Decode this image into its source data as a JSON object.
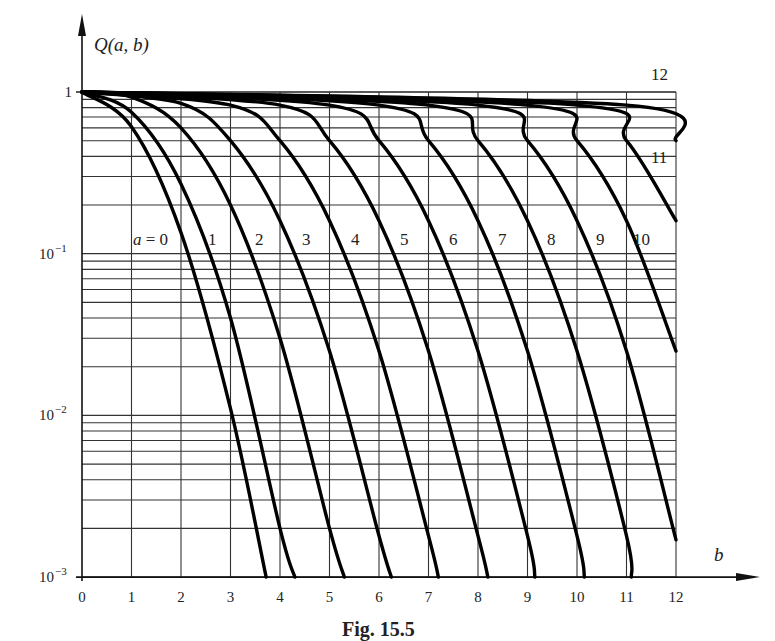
{
  "figure": {
    "caption": "Fig. 15.5",
    "y_axis_label": "Q(a, b)",
    "x_axis_label": "b"
  },
  "chart_data": {
    "type": "line",
    "title": "Q(a, b)",
    "xlabel": "b",
    "ylabel": "Q(a, b)",
    "xlim": [
      0,
      12
    ],
    "ylim": [
      0.001,
      1
    ],
    "yscale": "log",
    "x_ticks": [
      "0",
      "1",
      "2",
      "3",
      "4",
      "5",
      "6",
      "7",
      "8",
      "9",
      "10",
      "11",
      "12"
    ],
    "y_ticks": [
      "1",
      "10^-1",
      "10^-2",
      "10^-3"
    ],
    "grid": true,
    "legend_position": "inline curve labels",
    "series": [
      {
        "name": "a = 0",
        "label": "a = 0",
        "points": [
          [
            0,
            1
          ],
          [
            1,
            0.61
          ],
          [
            2,
            0.135
          ],
          [
            3,
            0.011
          ],
          [
            3.72,
            0.001
          ]
        ]
      },
      {
        "name": "a = 1",
        "label": "1",
        "points": [
          [
            0,
            1
          ],
          [
            1,
            0.75
          ],
          [
            2,
            0.27
          ],
          [
            3,
            0.04
          ],
          [
            4,
            0.002
          ],
          [
            4.3,
            0.001
          ]
        ]
      },
      {
        "name": "a = 2",
        "label": "2",
        "points": [
          [
            0,
            1
          ],
          [
            1,
            0.93
          ],
          [
            2,
            0.6
          ],
          [
            3,
            0.2
          ],
          [
            4,
            0.03
          ],
          [
            5,
            0.002
          ],
          [
            5.3,
            0.001
          ]
        ]
      },
      {
        "name": "a = 3",
        "label": "3",
        "points": [
          [
            0,
            1
          ],
          [
            2,
            0.85
          ],
          [
            3,
            0.5
          ],
          [
            4,
            0.16
          ],
          [
            5,
            0.025
          ],
          [
            6,
            0.0018
          ],
          [
            6.25,
            0.001
          ]
        ]
      },
      {
        "name": "a = 4",
        "label": "4",
        "points": [
          [
            0,
            1
          ],
          [
            3,
            0.83
          ],
          [
            4,
            0.5
          ],
          [
            5,
            0.16
          ],
          [
            6,
            0.025
          ],
          [
            7,
            0.0018
          ],
          [
            7.2,
            0.001
          ]
        ]
      },
      {
        "name": "a = 5",
        "label": "5",
        "points": [
          [
            0,
            1
          ],
          [
            4,
            0.83
          ],
          [
            5,
            0.5
          ],
          [
            6,
            0.16
          ],
          [
            7,
            0.025
          ],
          [
            8,
            0.0018
          ],
          [
            8.2,
            0.001
          ]
        ]
      },
      {
        "name": "a = 6",
        "label": "6",
        "points": [
          [
            0,
            1
          ],
          [
            5,
            0.83
          ],
          [
            6,
            0.5
          ],
          [
            7,
            0.16
          ],
          [
            8,
            0.025
          ],
          [
            9,
            0.0018
          ],
          [
            9.15,
            0.001
          ]
        ]
      },
      {
        "name": "a = 7",
        "label": "7",
        "points": [
          [
            0,
            1
          ],
          [
            6,
            0.83
          ],
          [
            7,
            0.5
          ],
          [
            8,
            0.16
          ],
          [
            9,
            0.025
          ],
          [
            10,
            0.0018
          ],
          [
            10.15,
            0.001
          ]
        ]
      },
      {
        "name": "a = 8",
        "label": "8",
        "points": [
          [
            0,
            1
          ],
          [
            7,
            0.83
          ],
          [
            8,
            0.5
          ],
          [
            9,
            0.16
          ],
          [
            10,
            0.025
          ],
          [
            11,
            0.0018
          ],
          [
            11.1,
            0.001
          ]
        ]
      },
      {
        "name": "a = 9",
        "label": "9",
        "points": [
          [
            0,
            1
          ],
          [
            8,
            0.83
          ],
          [
            9,
            0.5
          ],
          [
            10,
            0.16
          ],
          [
            11,
            0.025
          ],
          [
            12,
            0.0017
          ]
        ]
      },
      {
        "name": "a = 10",
        "label": "10",
        "points": [
          [
            0,
            1
          ],
          [
            9,
            0.83
          ],
          [
            10,
            0.5
          ],
          [
            11,
            0.16
          ],
          [
            12,
            0.025
          ]
        ]
      },
      {
        "name": "a = 11",
        "label": "11",
        "points": [
          [
            0,
            1
          ],
          [
            10,
            0.83
          ],
          [
            11,
            0.5
          ],
          [
            12,
            0.16
          ]
        ]
      },
      {
        "name": "a = 12",
        "label": "12",
        "points": [
          [
            0,
            1
          ],
          [
            11,
            0.83
          ],
          [
            12,
            0.5
          ]
        ]
      }
    ]
  }
}
